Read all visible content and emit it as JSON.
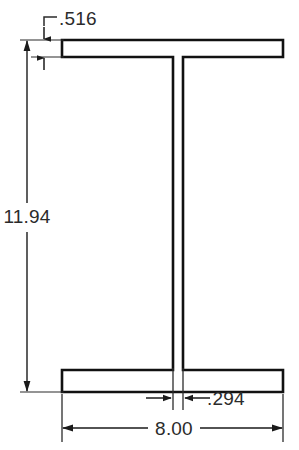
{
  "drawing": {
    "type": "engineering-dimensioned-cross-section",
    "shape": "wide-flange-I-beam",
    "units": "inches",
    "line_color": "#111111",
    "dimension_color": "#2b2b2b",
    "background_color": "#ffffff",
    "fill_color": "#ffffff"
  },
  "dimensions": {
    "flange_thickness": {
      "label": ".516",
      "name": "flange-thickness",
      "value": 0.516,
      "orientation": "vertical",
      "leader": "L-shaped"
    },
    "overall_depth": {
      "label": "11.94",
      "name": "overall-depth",
      "value": 11.94,
      "orientation": "vertical"
    },
    "web_thickness": {
      "label": ".294",
      "name": "web-thickness",
      "value": 0.294,
      "orientation": "horizontal",
      "arrows": "outside-pointing-in"
    },
    "flange_width": {
      "label": "8.00",
      "name": "flange-width",
      "value": 8.0,
      "orientation": "horizontal"
    }
  },
  "geometry": {
    "flange_left_x": 62,
    "flange_right_x": 283,
    "top_flange_top_y": 40,
    "top_flange_bottom_y": 57,
    "bottom_flange_top_y": 370,
    "bottom_flange_bottom_y": 392,
    "web_left_x": 173,
    "web_right_x": 183
  }
}
